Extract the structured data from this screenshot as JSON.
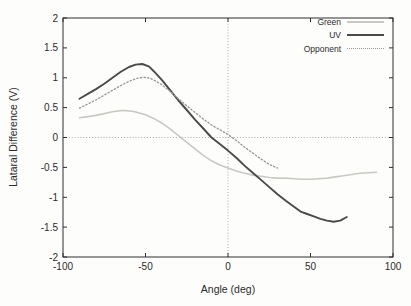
{
  "figure": {
    "background": "#fdfdfc",
    "frame_color": "#2f2f2f",
    "text_color": "#2b2b2b",
    "zero_axis_color": "#999999"
  },
  "chart_data": {
    "type": "line",
    "title": "",
    "xlabel": "Angle (deg)",
    "ylabel": "Lataral Difference (V)",
    "xlim": [
      -100,
      100
    ],
    "ylim": [
      -2,
      2
    ],
    "xticks": [
      -100,
      -50,
      0,
      50,
      100
    ],
    "yticks": [
      2,
      1.5,
      1,
      0.5,
      0,
      -0.5,
      -1,
      -1.5,
      -2
    ],
    "grid": "dotted-zero-axes",
    "legend_position": "top-right-inside",
    "series": [
      {
        "name": "Green",
        "color": "#c9c9c4",
        "style": "solid",
        "width": 1.6,
        "points": [
          [
            -90,
            0.33
          ],
          [
            -85,
            0.35
          ],
          [
            -80,
            0.37
          ],
          [
            -75,
            0.4
          ],
          [
            -70,
            0.43
          ],
          [
            -65,
            0.45
          ],
          [
            -62,
            0.45
          ],
          [
            -58,
            0.44
          ],
          [
            -55,
            0.42
          ],
          [
            -50,
            0.38
          ],
          [
            -45,
            0.32
          ],
          [
            -40,
            0.24
          ],
          [
            -35,
            0.14
          ],
          [
            -30,
            0.03
          ],
          [
            -25,
            -0.08
          ],
          [
            -20,
            -0.19
          ],
          [
            -15,
            -0.3
          ],
          [
            -10,
            -0.39
          ],
          [
            -5,
            -0.46
          ],
          [
            0,
            -0.51
          ],
          [
            5,
            -0.56
          ],
          [
            10,
            -0.6
          ],
          [
            15,
            -0.63
          ],
          [
            20,
            -0.65
          ],
          [
            25,
            -0.67
          ],
          [
            30,
            -0.68
          ],
          [
            35,
            -0.68
          ],
          [
            40,
            -0.69
          ],
          [
            45,
            -0.7
          ],
          [
            50,
            -0.7
          ],
          [
            55,
            -0.69
          ],
          [
            60,
            -0.68
          ],
          [
            65,
            -0.66
          ],
          [
            70,
            -0.64
          ],
          [
            75,
            -0.62
          ],
          [
            80,
            -0.6
          ],
          [
            85,
            -0.59
          ],
          [
            90,
            -0.58
          ]
        ]
      },
      {
        "name": "UV",
        "color": "#4a4a4a",
        "style": "solid",
        "width": 1.9,
        "points": [
          [
            -90,
            0.65
          ],
          [
            -85,
            0.73
          ],
          [
            -80,
            0.81
          ],
          [
            -75,
            0.9
          ],
          [
            -70,
            1.0
          ],
          [
            -65,
            1.1
          ],
          [
            -60,
            1.18
          ],
          [
            -56,
            1.22
          ],
          [
            -52,
            1.23
          ],
          [
            -48,
            1.19
          ],
          [
            -45,
            1.11
          ],
          [
            -40,
            0.96
          ],
          [
            -35,
            0.79
          ],
          [
            -30,
            0.62
          ],
          [
            -25,
            0.46
          ],
          [
            -20,
            0.3
          ],
          [
            -15,
            0.15
          ],
          [
            -10,
            0.0
          ],
          [
            -5,
            -0.11
          ],
          [
            0,
            -0.22
          ],
          [
            5,
            -0.34
          ],
          [
            10,
            -0.47
          ],
          [
            15,
            -0.59
          ],
          [
            20,
            -0.71
          ],
          [
            25,
            -0.83
          ],
          [
            30,
            -0.95
          ],
          [
            35,
            -1.06
          ],
          [
            40,
            -1.16
          ],
          [
            44,
            -1.24
          ],
          [
            48,
            -1.28
          ],
          [
            52,
            -1.32
          ],
          [
            56,
            -1.36
          ],
          [
            60,
            -1.39
          ],
          [
            64,
            -1.41
          ],
          [
            68,
            -1.39
          ],
          [
            72,
            -1.33
          ]
        ]
      },
      {
        "name": "Opponent",
        "color": "#9b9b9b",
        "style": "dotted",
        "width": 1.4,
        "points": [
          [
            -90,
            0.49
          ],
          [
            -85,
            0.56
          ],
          [
            -80,
            0.63
          ],
          [
            -75,
            0.71
          ],
          [
            -70,
            0.79
          ],
          [
            -65,
            0.87
          ],
          [
            -60,
            0.94
          ],
          [
            -55,
            0.99
          ],
          [
            -51,
            1.01
          ],
          [
            -47,
            0.99
          ],
          [
            -43,
            0.93
          ],
          [
            -40,
            0.88
          ],
          [
            -35,
            0.77
          ],
          [
            -30,
            0.65
          ],
          [
            -25,
            0.53
          ],
          [
            -20,
            0.42
          ],
          [
            -15,
            0.31
          ],
          [
            -10,
            0.21
          ],
          [
            -5,
            0.13
          ],
          [
            0,
            0.05
          ],
          [
            5,
            -0.05
          ],
          [
            10,
            -0.16
          ],
          [
            15,
            -0.26
          ],
          [
            20,
            -0.36
          ],
          [
            25,
            -0.45
          ],
          [
            30,
            -0.51
          ]
        ]
      }
    ]
  }
}
